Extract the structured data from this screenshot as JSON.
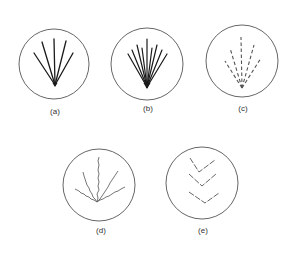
{
  "figure": {
    "panels": [
      {
        "id": "a",
        "label": "(a)",
        "description": "Five solid straight lines radiating from a single point",
        "line_style": "solid",
        "line_count": 5
      },
      {
        "id": "b",
        "label": "(b)",
        "description": "Nine solid straight lines radiating from a single point (dense fan)",
        "line_style": "solid",
        "line_count": 9
      },
      {
        "id": "c",
        "label": "(c)",
        "description": "Five dashed straight lines radiating from a single point",
        "line_style": "dashed",
        "line_count": 5
      },
      {
        "id": "d",
        "label": "(d)",
        "description": "Five wavy lines radiating from a single point",
        "line_style": "wavy",
        "line_count": 5
      },
      {
        "id": "e",
        "label": "(e)",
        "description": "Three stacked chevron (V) shapes",
        "line_style": "chevron",
        "line_count": 3
      }
    ],
    "colors": {
      "background": "#ffffff",
      "line": "#1a1a1a",
      "circle": "#555555",
      "label": "#333333"
    }
  }
}
